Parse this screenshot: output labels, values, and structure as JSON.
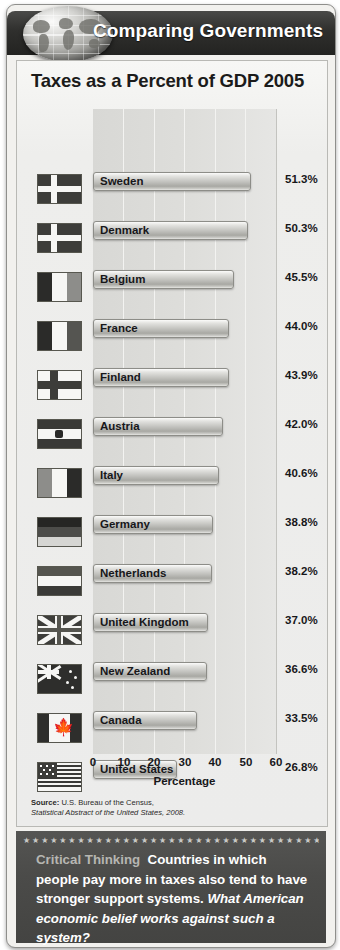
{
  "header": {
    "title": "Comparing Governments",
    "globe_icon": "globe-icon"
  },
  "chart_title": "Taxes as a Percent of GDP 2005",
  "chart_data": {
    "type": "bar",
    "orientation": "horizontal",
    "title": "Taxes as a Percent of GDP 2005",
    "xlabel": "Percentage",
    "ylabel": "",
    "xlim": [
      0,
      60
    ],
    "xticks": [
      "0",
      "10",
      "20",
      "30",
      "40",
      "50",
      "60"
    ],
    "grid": true,
    "legend": "none",
    "categories": [
      "Sweden",
      "Denmark",
      "Belgium",
      "France",
      "Finland",
      "Austria",
      "Italy",
      "Germany",
      "Netherlands",
      "United Kingdom",
      "New Zealand",
      "Canada",
      "United States"
    ],
    "values": [
      51.3,
      50.3,
      45.5,
      44.0,
      43.9,
      42.0,
      40.6,
      38.8,
      38.2,
      37.0,
      36.6,
      33.5,
      26.8
    ],
    "value_labels": [
      "51.3%",
      "50.3%",
      "45.5%",
      "44.0%",
      "43.9%",
      "42.0%",
      "40.6%",
      "38.8%",
      "38.2%",
      "37.0%",
      "36.6%",
      "33.5%",
      "26.8%"
    ],
    "flags": [
      "sweden-flag-icon",
      "denmark-flag-icon",
      "belgium-flag-icon",
      "france-flag-icon",
      "finland-flag-icon",
      "austria-flag-icon",
      "italy-flag-icon",
      "germany-flag-icon",
      "netherlands-flag-icon",
      "united-kingdom-flag-icon",
      "new-zealand-flag-icon",
      "canada-flag-icon",
      "united-states-flag-icon"
    ]
  },
  "source": {
    "label": "Source:",
    "line1": "U.S. Bureau of the Census,",
    "line2": "Statistical Abstract of the United States, 2008."
  },
  "critical_thinking": {
    "label": "Critical Thinking",
    "text": "Countries in which people pay more in taxes also tend to have stronger support systems.",
    "question": "What American economic belief works against such a system?",
    "star_row": "★★★★★★★★★★★★★★★★★★★★★★★★★★★★★★★★★★"
  },
  "colors": {
    "header_dark": "#2f2f2d",
    "panel_bg": "#ececeb",
    "plot_bg": "#dedede",
    "bar_face": "#c2c2be",
    "ct_bg": "#4b4b49",
    "text": "#17171a"
  }
}
